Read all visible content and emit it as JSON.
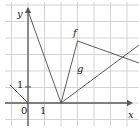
{
  "figure": {
    "width": 139,
    "height": 132
  },
  "axes": {
    "x_label": "x",
    "y_label": "y",
    "origin_label": "0",
    "x_unit_label": "1",
    "y_unit_label": "1",
    "x_axis_color": "#5a5a5a",
    "y_axis_color": "#5a5a5a",
    "grid_color": "#c9c9c9",
    "grid_spacing_px": 16.5,
    "x_range": [
      -1,
      6.7
    ],
    "y_range": [
      -0.4,
      5.7
    ],
    "origin_px": {
      "x": 28,
      "y": 103
    },
    "x_arrow_px": {
      "x": 128,
      "y": 103
    },
    "y_arrow_px": {
      "x": 28,
      "y": 8
    }
  },
  "grid": {
    "vertical_x_px": [
      11.5,
      28,
      44.5,
      61,
      77.5,
      94,
      110.5,
      127
    ],
    "horizontal_y_px": [
      5,
      21.5,
      38,
      54.5,
      71,
      87.5,
      103,
      119.5
    ]
  },
  "curves": [
    {
      "name": "f",
      "label": "f",
      "color": "#4a4a4a",
      "stroke_width": 0.9,
      "label_px": {
        "x": 73,
        "y": 28
      },
      "points_px": [
        {
          "x": 28,
          "y": 11
        },
        {
          "x": 61,
          "y": 103
        },
        {
          "x": 77.5,
          "y": 41
        },
        {
          "x": 139,
          "y": 63
        }
      ],
      "points_data": [
        {
          "x": 0,
          "y": 5.6
        },
        {
          "x": 2,
          "y": 0
        },
        {
          "x": 3,
          "y": 3.8
        },
        {
          "x": 6.7,
          "y": 2.4
        }
      ]
    },
    {
      "name": "g",
      "label": "g",
      "color": "#4a4a4a",
      "stroke_width": 0.9,
      "label_px": {
        "x": 77,
        "y": 64
      },
      "points_px": [
        {
          "x": 61,
          "y": 103
        },
        {
          "x": 139,
          "y": 45
        }
      ],
      "points_data": [
        {
          "x": 2,
          "y": 0
        },
        {
          "x": 6.7,
          "y": 3.5
        }
      ]
    },
    {
      "name": "f-left-segment",
      "label": "",
      "color": "#4a4a4a",
      "stroke_width": 0.9,
      "points_px": [
        {
          "x": 10,
          "y": 85
        },
        {
          "x": 28,
          "y": 103
        }
      ],
      "points_data": [
        {
          "x": -1.1,
          "y": 1.1
        },
        {
          "x": 0,
          "y": 0
        }
      ]
    }
  ],
  "ticks": {
    "y_one_tick_px": {
      "x1": 25,
      "y1": 87,
      "x2": 31,
      "y2": 87
    }
  },
  "chart_data": {
    "type": "line",
    "xlabel": "x",
    "ylabel": "y",
    "xlim": [
      -1,
      6.7
    ],
    "ylim": [
      -0.4,
      5.7
    ],
    "grid": true,
    "legend": "inline-labels",
    "series": [
      {
        "name": "f",
        "x": [
          0,
          2,
          3,
          6.7
        ],
        "y": [
          5.6,
          0,
          3.8,
          2.4
        ]
      },
      {
        "name": "g",
        "x": [
          2,
          6.7
        ],
        "y": [
          0,
          3.5
        ]
      }
    ],
    "annotations": [
      "f",
      "g",
      "0",
      "1",
      "1"
    ]
  }
}
